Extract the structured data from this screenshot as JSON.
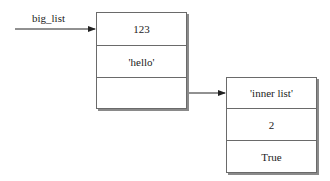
{
  "diagram": {
    "variable": {
      "label": "big_list"
    },
    "outer_list": {
      "cells": [
        {
          "value": "123"
        },
        {
          "value": "'hello'"
        },
        {
          "value": ""
        }
      ]
    },
    "inner_list": {
      "cells": [
        {
          "value": "'inner list'"
        },
        {
          "value": "2"
        },
        {
          "value": "True"
        }
      ]
    },
    "colors": {
      "line": "#222222",
      "border": "#6a6a6a",
      "shadow": "#8a8a8a"
    }
  }
}
